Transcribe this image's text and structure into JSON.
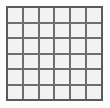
{
  "figure": {
    "name": "grid",
    "rows": 6,
    "columns": 6,
    "cell_count": 36,
    "colors": {
      "background": "#fdfdfd",
      "cell_fill": "#f2f2f2",
      "grid_line": "#6e6e6e",
      "outer_border": "#5a5a5a"
    },
    "geometry": {
      "left": 6,
      "top": 6,
      "width": 97,
      "height": 95,
      "line_width": 2,
      "outer_border_width": 2
    },
    "cells": [
      [
        "",
        "",
        "",
        "",
        "",
        ""
      ],
      [
        "",
        "",
        "",
        "",
        "",
        ""
      ],
      [
        "",
        "",
        "",
        "",
        "",
        ""
      ],
      [
        "",
        "",
        "",
        "",
        "",
        ""
      ],
      [
        "",
        "",
        "",
        "",
        "",
        ""
      ],
      [
        "",
        "",
        "",
        "",
        "",
        ""
      ]
    ]
  }
}
